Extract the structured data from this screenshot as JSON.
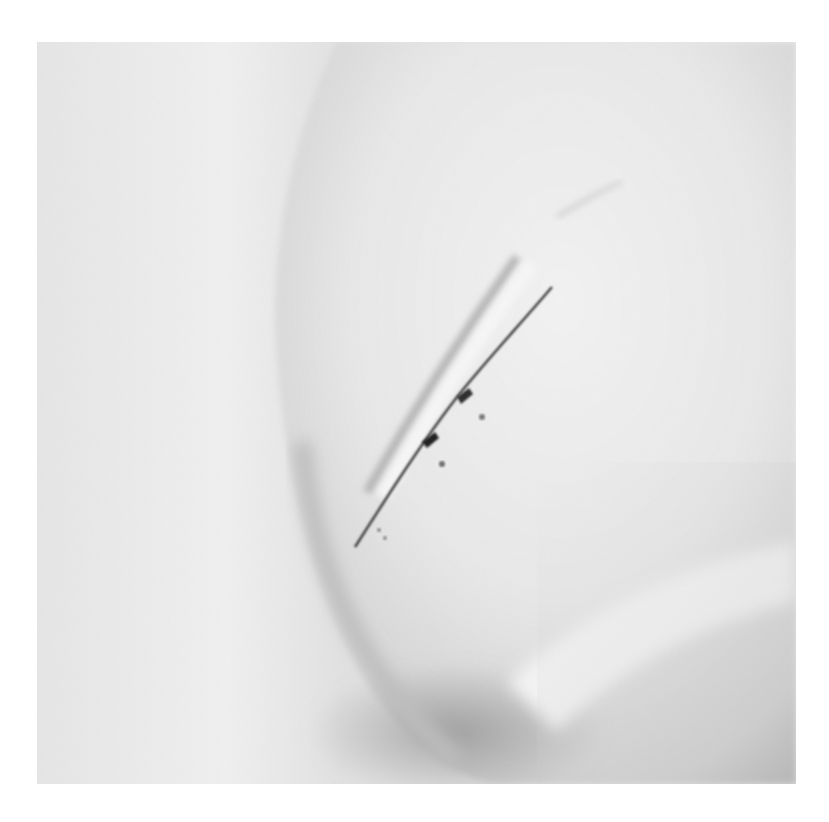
{
  "image": {
    "alt": "Black-and-white close-up photograph of skin with a healing diagonal incision scar",
    "palette": {
      "border": "#ffffff",
      "background_left": "#ececec",
      "skin_light": "#f1f1f1",
      "skin_mid": "#d9d9d9",
      "shadow": "#9a9a9a",
      "scar_dark": "#2a2a2a"
    },
    "subjects": [
      "skin-fold",
      "incision-scar",
      "soft-shadow"
    ]
  }
}
